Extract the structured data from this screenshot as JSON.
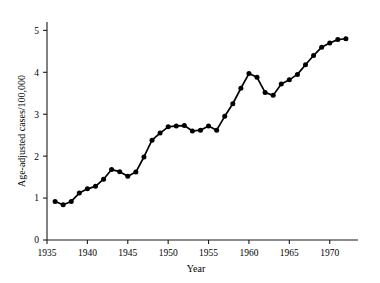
{
  "chart_data": {
    "type": "line",
    "title": "",
    "xlabel": "Year",
    "ylabel": "Age-adjusted cases/100,000",
    "xlim": [
      1935,
      1973.5
    ],
    "ylim": [
      0,
      5.2
    ],
    "grid": false,
    "legend": null,
    "xticks": [
      1935,
      1940,
      1945,
      1950,
      1955,
      1960,
      1965,
      1970
    ],
    "xticklabels": [
      "1935",
      "1940",
      "1945",
      "1950",
      "1955",
      "1960",
      "1965",
      "1970"
    ],
    "yticks": [
      0,
      1,
      2,
      3,
      4,
      5
    ],
    "yticklabels": [
      "0",
      "1",
      "2",
      "3",
      "4",
      "5"
    ],
    "marker": "filled-circle",
    "line_color": "#000000",
    "x": [
      1936,
      1937,
      1938,
      1939,
      1940,
      1941,
      1942,
      1943,
      1944,
      1945,
      1946,
      1947,
      1948,
      1949,
      1950,
      1951,
      1952,
      1953,
      1954,
      1955,
      1956,
      1957,
      1958,
      1959,
      1960,
      1961,
      1962,
      1963,
      1964,
      1965,
      1966,
      1967,
      1968,
      1969,
      1970,
      1971,
      1972
    ],
    "values": [
      0.92,
      0.84,
      0.92,
      1.12,
      1.22,
      1.28,
      1.45,
      1.68,
      1.63,
      1.52,
      1.62,
      1.98,
      2.38,
      2.55,
      2.7,
      2.72,
      2.73,
      2.6,
      2.62,
      2.72,
      2.62,
      2.95,
      3.25,
      3.62,
      3.97,
      3.88,
      3.52,
      3.45,
      3.72,
      3.82,
      3.95,
      4.18,
      4.4,
      4.6,
      4.7,
      4.78,
      4.8
    ]
  },
  "axes": {
    "x_title": "Year",
    "y_title": "Age-adjusted cases/100,000"
  }
}
